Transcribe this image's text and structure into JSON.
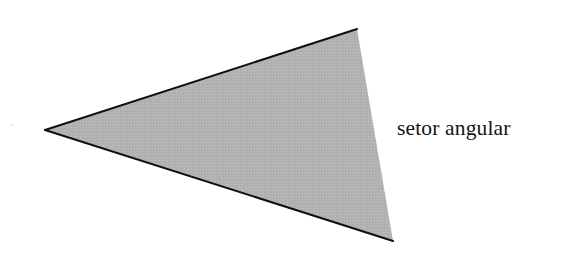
{
  "figure": {
    "kind": "geometric-diagram",
    "title": "setor angular",
    "background_color": "#ffffff",
    "canvas": {
      "width": 569,
      "height": 264
    },
    "shape": {
      "name": "angular-sector-triangle",
      "fill_color": "#b2b2b2",
      "fill_texture": "halftone-dither",
      "stroke_color": "#101010",
      "stroke_width": 2,
      "stroked_edges": [
        "top",
        "bottom"
      ],
      "unstroked_edges": [
        "right"
      ],
      "vertices": [
        {
          "name": "apex-left",
          "x": 45,
          "y": 130
        },
        {
          "name": "vertex-top-right",
          "x": 357,
          "y": 29
        },
        {
          "name": "vertex-bottom-right",
          "x": 393,
          "y": 241
        }
      ],
      "points_path": "45,130 357,29 393,241",
      "top_edge_path": "M 45 130 L 357 29",
      "bottom_edge_path": "M 45 130 L 393 241"
    },
    "label": {
      "text": "setor angular",
      "color": "#141414",
      "font_size_px": 21.5,
      "x": 397,
      "y": 118,
      "baseline_y": 141
    },
    "artifacts": [
      {
        "name": "scan-speck",
        "x": 11,
        "y": 124,
        "color": "#e2e2e2"
      }
    ]
  }
}
